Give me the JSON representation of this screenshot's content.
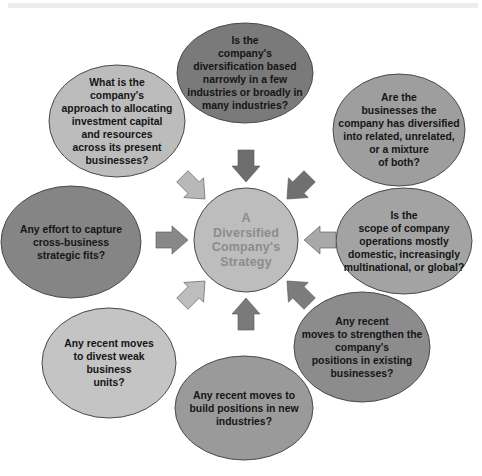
{
  "diagram": {
    "center": {
      "label": "A\nDiversified\nCompany's\nStrategy",
      "fill": "#bdbdbd"
    },
    "questions": [
      {
        "id": "top",
        "text": "Is the\ncompany's\ndiversification  based\nnarrowly in a few\nindustries or broadly in\nmany industries?",
        "fill": "#7a7a7a"
      },
      {
        "id": "upper-right",
        "text": "Are the\nbusinesses the\ncompany has diversified\ninto related, unrelated,\nor a mixture\nof both?",
        "fill": "#9e9e9e"
      },
      {
        "id": "right",
        "text": "Is the\nscope of company\noperations mostly\ndomestic, increasingly\nmultinational, or global?",
        "fill": "#a3a3a3"
      },
      {
        "id": "lower-right",
        "text": "Any recent\nmoves to strengthen the\ncompany's\npositions in existing\nbusinesses?",
        "fill": "#8c8c8c"
      },
      {
        "id": "bottom",
        "text": "Any recent moves to\nbuild positions in new\nindustries?",
        "fill": "#9a9a9a"
      },
      {
        "id": "lower-left",
        "text": "Any recent moves\nto divest weak\nbusiness\nunits?",
        "fill": "#c4c4c4"
      },
      {
        "id": "left",
        "text": "Any effort to capture\ncross-business\nstrategic fits?",
        "fill": "#858585"
      },
      {
        "id": "upper-left",
        "text": "What is the\ncompany's\napproach to allocating\ninvestment capital\nand resources\nacross its present\nbusinesses?",
        "fill": "#bcbcbc"
      }
    ],
    "arrows": [
      {
        "id": "from-top",
        "fill": "#6e6e6e"
      },
      {
        "id": "from-upper-right",
        "fill": "#707070"
      },
      {
        "id": "from-right",
        "fill": "#a8a8a8"
      },
      {
        "id": "from-lower-right",
        "fill": "#7c7c7c"
      },
      {
        "id": "from-bottom",
        "fill": "#7a7a7a"
      },
      {
        "id": "from-lower-left",
        "fill": "#bdbdbd"
      },
      {
        "id": "from-left",
        "fill": "#888888"
      },
      {
        "id": "from-upper-left",
        "fill": "#b8b8b8"
      }
    ],
    "outline_color": "#4a4a4a"
  }
}
